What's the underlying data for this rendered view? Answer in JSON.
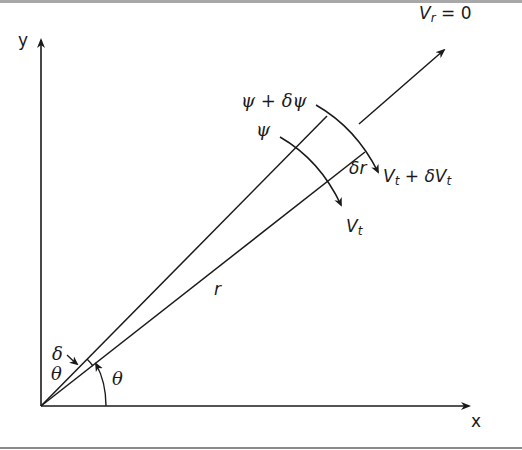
{
  "diagram": {
    "axes": {
      "x_label": "x",
      "y_label": "y"
    },
    "labels": {
      "vr": "V",
      "vr_sub": "r",
      "vr_eq": " = 0",
      "psi_plus": "ψ + δψ",
      "psi": "ψ",
      "dr": "δr",
      "vt_plus_a": "V",
      "vt_plus_sub_a": "t",
      "vt_plus_mid": " + δV",
      "vt_plus_sub_b": "t",
      "vt": "V",
      "vt_sub": "t",
      "r": "r",
      "delta": "δ",
      "theta_small": "θ",
      "theta": "θ"
    },
    "colors": {
      "line": "#1a1a1a",
      "background": "#ffffff",
      "border": "#9a9a9a"
    }
  }
}
